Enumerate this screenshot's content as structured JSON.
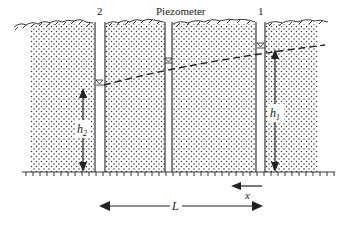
{
  "diagram": {
    "title": "Piezometer",
    "piezometers": [
      {
        "id": "2",
        "label": "2"
      },
      {
        "id": "mid",
        "label": ""
      },
      {
        "id": "1",
        "label": "1"
      }
    ],
    "heads": {
      "h2": {
        "label": "h",
        "sub": "2"
      },
      "h1": {
        "label": "h",
        "sub": "1"
      }
    },
    "x_label": "x",
    "L_label": "L",
    "colors": {
      "line": "#222222",
      "dots": "#333333",
      "background": "#ffffff"
    }
  }
}
